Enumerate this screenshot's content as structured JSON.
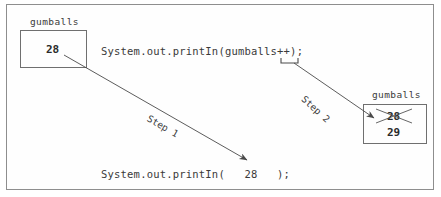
{
  "figure": {
    "background": "#ffffff",
    "frame_color": "#8e8e8e",
    "ink_color": "#3a3a3a"
  },
  "boxes": [
    {
      "id": "gumballs-before",
      "label": "gumballs",
      "value": "28",
      "old_value": null,
      "struck": false,
      "x": 20,
      "y": 30,
      "width": 67,
      "height": 38
    },
    {
      "id": "gumballs-after",
      "label": "gumballs",
      "value": "29",
      "old_value": "28",
      "struck": true,
      "x": 363,
      "y": 104,
      "width": 64,
      "height": 40
    }
  ],
  "code_lines": [
    {
      "id": "source-statement",
      "text": "System.out.printIn(gumballs++);",
      "x": 101,
      "y": 45
    },
    {
      "id": "output-statement",
      "text": "System.out.printIn(   28   );",
      "x": 101,
      "y": 168
    }
  ],
  "steps": [
    {
      "id": "step-1",
      "label": "Step 1",
      "x": 148,
      "y": 112,
      "rotation": 30
    },
    {
      "id": "step-2",
      "label": "Step 2",
      "x": 303,
      "y": 92,
      "rotation": 42
    }
  ],
  "annotations": {
    "increment_bracket_target": "++",
    "strikeout_value": "28",
    "new_value": "29"
  },
  "colors": {
    "ink": "#3a3a3a",
    "box_border": "#6f6f6f",
    "frame": "#8e8e8e",
    "value_text": "#2b2b2b",
    "arrow": "#4a4a4a"
  }
}
